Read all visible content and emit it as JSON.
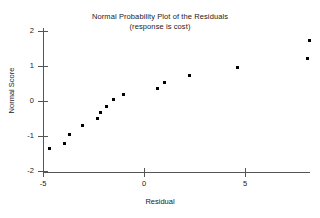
{
  "chart_data": {
    "type": "scatter",
    "title": "Normal Probability Plot of the Residuals",
    "subtitle": "(response is cost)",
    "xlabel": "Residual",
    "ylabel": "Normal Score",
    "xlim": [
      -5.6,
      8.6
    ],
    "ylim": [
      -2.1,
      2.25
    ],
    "grid": false,
    "legend": null,
    "xticks": [
      -5,
      0,
      5
    ],
    "xtick_labels": [
      "-5",
      "0",
      "5"
    ],
    "yticks": [
      2,
      1,
      0,
      -1,
      -2
    ],
    "ytick_labels": [
      "2",
      "1",
      "0",
      "-1",
      "-2"
    ],
    "marker": "filled-square",
    "marker_color": "#000000",
    "points": [
      {
        "x": -4.7,
        "y": -1.35
      },
      {
        "x": -3.95,
        "y": -1.2
      },
      {
        "x": -3.7,
        "y": -0.95
      },
      {
        "x": -3.05,
        "y": -0.7
      },
      {
        "x": -2.3,
        "y": -0.5
      },
      {
        "x": -2.15,
        "y": -0.33
      },
      {
        "x": -1.85,
        "y": -0.17
      },
      {
        "x": -1.5,
        "y": 0.03
      },
      {
        "x": -1.0,
        "y": 0.18
      },
      {
        "x": 0.65,
        "y": 0.37
      },
      {
        "x": 1.0,
        "y": 0.52
      },
      {
        "x": 2.25,
        "y": 0.72
      },
      {
        "x": 4.65,
        "y": 0.95
      },
      {
        "x": 8.1,
        "y": 1.22
      },
      {
        "x": 8.2,
        "y": 1.73
      }
    ]
  }
}
